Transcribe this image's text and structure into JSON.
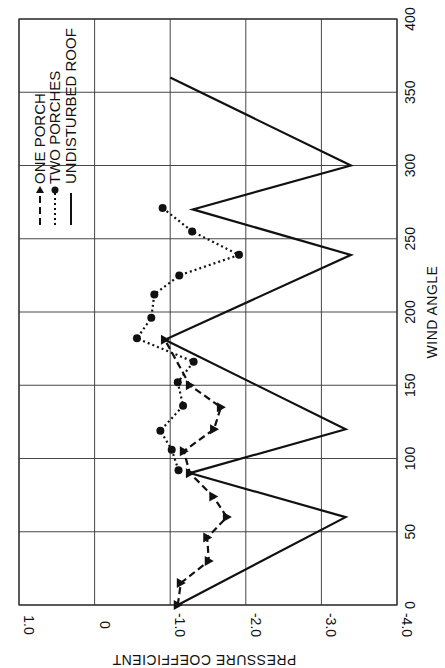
{
  "chart_data": {
    "type": "line",
    "orientation": "rotated 90° counter-clockwise (x-axis vertical on right, y-axis horizontal at bottom, upside-down text)",
    "title": "",
    "xlabel": "WIND ANGLE",
    "ylabel": "PRESSURE COEFFICIENT",
    "xlim": [
      0,
      400
    ],
    "ylim": [
      -4.0,
      1.0
    ],
    "x_ticks": [
      "0",
      "50",
      "100",
      "150",
      "200",
      "250",
      "300",
      "350",
      "400"
    ],
    "y_ticks": [
      "1.0",
      "0",
      "-1.0",
      "-2.0",
      "-3.0",
      "-4.0"
    ],
    "grid": true,
    "legend_position": "upper-left (rotated)",
    "series": [
      {
        "name": "ONE PORCH",
        "style": "dashed",
        "marker": "triangle",
        "x": [
          0,
          15,
          30,
          46,
          60,
          74,
          90,
          105,
          120,
          135,
          150,
          181
        ],
        "y": [
          -1.1,
          -1.14,
          -1.51,
          -1.49,
          -1.75,
          -1.57,
          -1.26,
          -1.18,
          -1.58,
          -1.67,
          -1.26,
          -0.93
        ]
      },
      {
        "name": "TWO PORCHES",
        "style": "dotted",
        "marker": "circle",
        "x": [
          92,
          106,
          119,
          136,
          152,
          166,
          182,
          196,
          212,
          225,
          239,
          255,
          271
        ],
        "y": [
          -1.11,
          -1.02,
          -0.87,
          -1.17,
          -1.1,
          -1.31,
          -0.56,
          -0.75,
          -0.79,
          -1.12,
          -1.91,
          -1.29,
          -0.9
        ]
      },
      {
        "name": "UNDISTURBED ROOF",
        "style": "solid",
        "marker": "none",
        "x": [
          0,
          60,
          90,
          120,
          181,
          239,
          270,
          300,
          360
        ],
        "y": [
          -1.1,
          -3.32,
          -1.26,
          -3.32,
          -0.93,
          -3.39,
          -1.3,
          -3.39,
          -1.0
        ]
      }
    ]
  }
}
